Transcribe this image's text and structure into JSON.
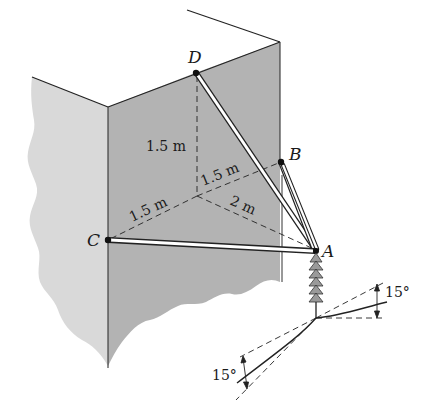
{
  "figure": {
    "colors": {
      "wall_right": "#b4b4b4",
      "wall_left": "#d8d8d8",
      "line": "#222222",
      "cable_fill": "#ffffff"
    },
    "points": {
      "A": "A",
      "B": "B",
      "C": "C",
      "D": "D"
    },
    "dimensions": {
      "od_vertical": "1.5 m",
      "ob": "1.5 m",
      "oc": "1.5 m",
      "oa": "2 m"
    },
    "angles": {
      "right_wire": "15°",
      "left_wire": "15°"
    }
  }
}
